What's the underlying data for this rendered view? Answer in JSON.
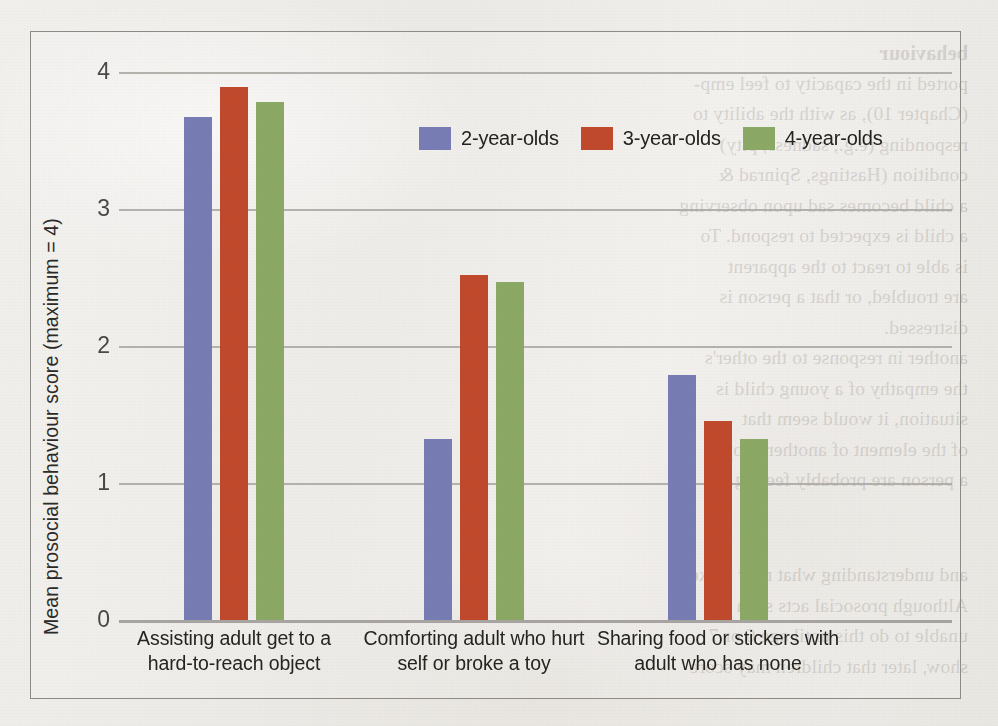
{
  "chart_data": {
    "type": "bar",
    "title": "",
    "xlabel": "",
    "ylabel": "Mean prosocial behaviour score (maximum = 4)",
    "ylim": [
      0,
      4
    ],
    "yticks": [
      "0",
      "1",
      "2",
      "3",
      "4"
    ],
    "grid": true,
    "legend_position": "top-center",
    "categories": [
      "Assisting adult get to a\nhard-to-reach object",
      "Comforting adult who hurt\nself or broke a toy",
      "Sharing food or stickers with\nadult who has none"
    ],
    "category_lines": [
      [
        "Assisting adult get to a",
        "hard-to-reach object"
      ],
      [
        "Comforting adult who hurt",
        "self or broke a toy"
      ],
      [
        "Sharing food or stickers with",
        "adult who has none"
      ]
    ],
    "series": [
      {
        "name": "2-year-olds",
        "color": "#777cb4",
        "values": [
          3.67,
          1.32,
          1.79
        ]
      },
      {
        "name": "3-year-olds",
        "color": "#c0492c",
        "values": [
          3.89,
          2.52,
          1.45
        ]
      },
      {
        "name": "4-year-olds",
        "color": "#8ba865",
        "values": [
          3.78,
          2.47,
          1.32
        ]
      }
    ]
  },
  "legend": {
    "items": [
      {
        "label": "2-year-olds",
        "color": "#777cb4"
      },
      {
        "label": "3-year-olds",
        "color": "#c0492c"
      },
      {
        "label": "4-year-olds",
        "color": "#8ba865"
      }
    ]
  },
  "axis": {
    "y_title": "Mean prosocial behaviour score (maximum = 4)",
    "y_tick_labels": [
      "4",
      "3",
      "2",
      "1",
      "0"
    ]
  },
  "showthrough": {
    "lines": [
      "behaviour",
      "ported in the capacity to feel emp-",
      "(Chapter 10), as with the ability to",
      "responding (e.g., sadness, pity)",
      "condition (Hastings, Spinrad &",
      "a child becomes sad upon observing",
      "a child is expected to respond. To",
      "is able to react to the apparent",
      "are troubled, or that a person is",
      "distressed.",
      "another in response to the other's",
      "the empathy of a young child is",
      "situation, it would seem that",
      "of the element of another people",
      "a person are probably feeling the"
    ],
    "lines_lower": [
      "and understanding what may make",
      "Although prosocial acts such",
      "unable to do this until age 6 or 7",
      "show, later that children may score"
    ]
  }
}
